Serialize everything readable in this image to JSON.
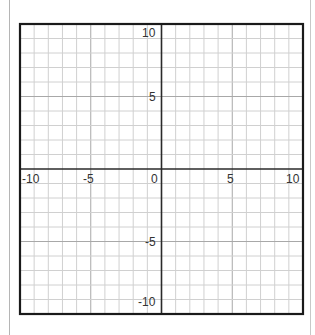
{
  "chart_data": {
    "type": "coordinate-grid",
    "title": "",
    "xlabel": "",
    "ylabel": "",
    "xlim": [
      -10,
      10
    ],
    "ylim": [
      -10,
      10
    ],
    "grid": true,
    "minor_step": 1,
    "major_step": 5,
    "x_tick_labels": [
      "-10",
      "-5",
      "0",
      "5",
      "10"
    ],
    "y_tick_labels": [
      "10",
      "5",
      "-5",
      "-10"
    ],
    "series": []
  },
  "labels": {
    "x": {
      "neg10": "-10",
      "neg5": "-5",
      "zero": "0",
      "pos5": "5",
      "pos10": "10"
    },
    "y": {
      "pos10": "10",
      "pos5": "5",
      "neg5": "-5",
      "neg10": "-10"
    }
  },
  "colors": {
    "minor_grid": "#d0d0d0",
    "major_grid": "#a8a8a8",
    "axis": "#2a2a2a",
    "border": "#1a1a1a"
  }
}
